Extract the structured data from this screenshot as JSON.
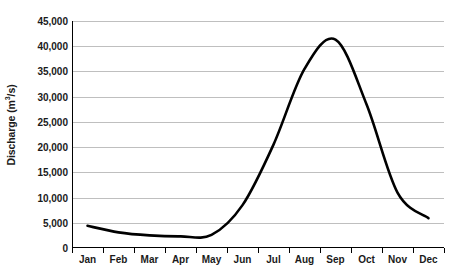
{
  "chart_data": {
    "type": "line",
    "title": "",
    "subtitle": "",
    "xlabel": "",
    "ylabel": "Discharge (m³/s)",
    "ylabel_parts": {
      "main": "Discharge (m",
      "sup": "3",
      "tail": "/s)"
    },
    "categories": [
      "Jan",
      "Feb",
      "Mar",
      "Apr",
      "May",
      "Jun",
      "Jul",
      "Aug",
      "Sep",
      "Oct",
      "Nov",
      "Dec"
    ],
    "values": [
      4400,
      3100,
      2500,
      2300,
      2600,
      8500,
      20500,
      35500,
      41300,
      28500,
      11000,
      5900
    ],
    "series": [
      {
        "name": "Discharge",
        "values": [
          4400,
          3100,
          2500,
          2300,
          2600,
          8500,
          20500,
          35500,
          41300,
          28500,
          11000,
          5900
        ],
        "color": "#000000",
        "line_width": 2.6,
        "smooth": true,
        "markers": false
      }
    ],
    "ylim": [
      0,
      45000
    ],
    "ytick_values": [
      0,
      5000,
      10000,
      15000,
      20000,
      25000,
      30000,
      35000,
      40000,
      45000
    ],
    "ytick_labels": [
      "0",
      "5,000",
      "10,000",
      "15,000",
      "20,000",
      "25,000",
      "30,000",
      "35,000",
      "40,000",
      "45,000"
    ],
    "grid": {
      "horizontal": true,
      "vertical": false,
      "color": "#bfbfbf"
    },
    "legend": {
      "visible": false,
      "position": "none"
    },
    "axis_color": "#000000",
    "background_color": "#ffffff",
    "peak": {
      "category": "Sep",
      "value": 41300
    },
    "minimum": {
      "category": "Apr",
      "value": 2300
    }
  }
}
